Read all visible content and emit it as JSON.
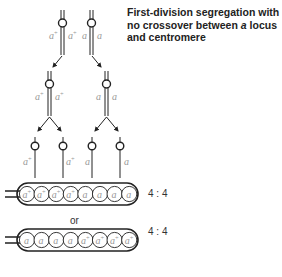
{
  "title": {
    "part1": "First-division segregation with no crossover between ",
    "italic": "a",
    "part2": " locus and centromere"
  },
  "alleles": {
    "wild": "a⁺",
    "mutant": "a"
  },
  "meiosis": {
    "stage1": {
      "left_pair": [
        "a⁺",
        "a⁺"
      ],
      "right_pair": [
        "a",
        "a"
      ]
    },
    "stage2": {
      "left_pair": [
        "a⁺",
        "a⁺"
      ],
      "right_pair": [
        "a",
        "a"
      ]
    },
    "stage3": [
      "a⁺",
      "a⁺",
      "a",
      "a"
    ]
  },
  "asci": [
    {
      "spores": [
        "a⁺",
        "a⁺",
        "a⁺",
        "a⁺",
        "a",
        "a",
        "a",
        "a"
      ],
      "ratio": "4 : 4"
    },
    {
      "spores": [
        "a",
        "a",
        "a",
        "a",
        "a⁺",
        "a⁺",
        "a⁺",
        "a⁺"
      ],
      "ratio": "4 : 4"
    }
  ],
  "or_label": "or",
  "colors": {
    "line": "#222222",
    "label": "#999999",
    "text": "#222222"
  }
}
